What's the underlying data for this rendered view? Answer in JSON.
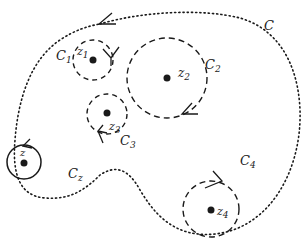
{
  "diagram": {
    "type": "complex-contour-diagram",
    "colors": {
      "stroke": "#1a1a1a",
      "background": "#ffffff"
    },
    "outer_contour": {
      "label": "C",
      "style": "dotted",
      "orientation": "counterclockwise"
    },
    "circles": [
      {
        "id": "C1",
        "label_main": "C",
        "label_sub": "1",
        "point_main": "z",
        "point_sub": "1",
        "style": "dashed"
      },
      {
        "id": "C2",
        "label_main": "C",
        "label_sub": "2",
        "point_main": "z",
        "point_sub": "2",
        "style": "dashed"
      },
      {
        "id": "C3",
        "label_main": "C",
        "label_sub": "3",
        "point_main": "z",
        "point_sub": "3",
        "style": "dashed"
      },
      {
        "id": "C4",
        "label_main": "C",
        "label_sub": "4",
        "point_main": "z",
        "point_sub": "4",
        "style": "dashed"
      },
      {
        "id": "Cz",
        "label_main": "C",
        "label_sub": "z",
        "point_main": "z",
        "point_sub": "",
        "style": "solid"
      }
    ]
  }
}
